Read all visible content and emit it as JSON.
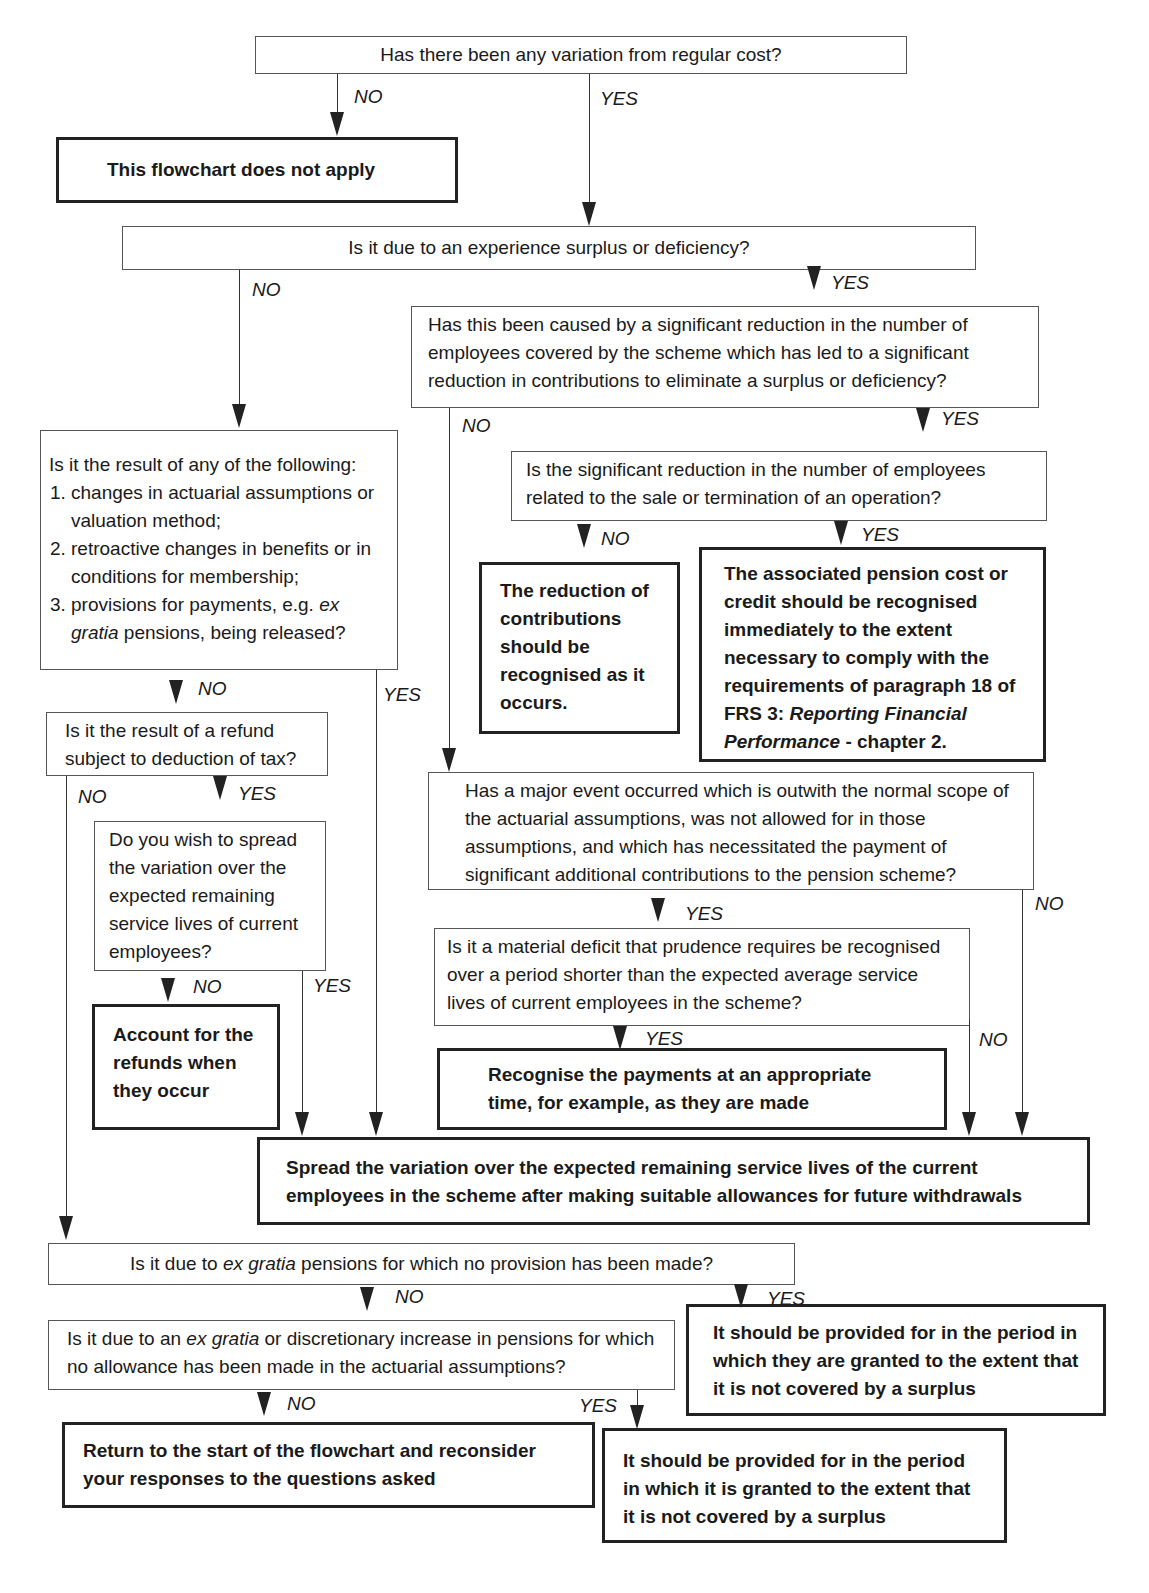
{
  "header_fragment": "",
  "nodes": {
    "q1": "Has there been any variation from regular cost?",
    "end_not_apply": "This flowchart does not apply",
    "q2": "Is it due to an experience surplus or deficiency?",
    "q3": "Has this been caused by a significant reduction in the number of employees covered by the scheme which has led to a significant reduction in contributions to eliminate a surplus or deficiency?",
    "q4": "Is the significant reduction in the number of employees related to the sale or termination of an operation?",
    "end_reduction": "The reduction of contributions should be recognised as it occurs.",
    "end_associated_a": "The associated pension cost or credit should be recognised immediately to the extent necessary to comply with the requirements of paragraph 18 of FRS 3: ",
    "end_associated_italic": "Reporting Financial Performance",
    "end_associated_b": " - chapter 2.",
    "q5_intro": "Is it the result of any of the following:",
    "q5_items": [
      "changes in actuarial assumptions or valuation method;",
      "retroactive changes in benefits or in conditions for  membership;"
    ],
    "q5_item3_a": "provisions for payments, e.g. ",
    "q5_item3_italic": "ex gratia",
    "q5_item3_b": " pensions, being released?",
    "q6": "Is it the result of a refund subject to deduction of tax?",
    "q7": "Do you wish to spread the variation over the expected remaining service lives of current employees?",
    "end_refunds": "Account for the refunds when they occur",
    "q8": "Has a major event occurred which is outwith the normal scope of the actuarial assumptions, was not allowed for in those assumptions, and which has necessitated the payment of significant additional contributions to the pension scheme?",
    "q9": "Is it a material deficit that prudence requires be recognised over a period shorter than the expected average service lives of current employees in the scheme?",
    "end_recognise_payments": "Recognise the payments at an appropriate time, for example, as they are made",
    "end_spread": "Spread the variation over the expected remaining service lives of the current employees in the scheme after making suitable allowances for future withdrawals",
    "q10_a": "Is it due to ",
    "q10_italic": "ex gratia",
    "q10_b": " pensions for which no provision has been made?",
    "end_provided_they": "It should be provided for in the period in which they are granted to the extent that it is not covered by a surplus",
    "q11_a": "Is it due to an ",
    "q11_italic": "ex gratia",
    "q11_b": " or discretionary increase in pensions for which no allowance has been made in the actuarial assumptions?",
    "end_return": "Return to the start of the flowchart and reconsider your responses to the questions asked",
    "end_provided_it": "It should be provided for in the period in which it is granted to the extent that it is not covered by a surplus"
  },
  "labels": {
    "yes": "YES",
    "no": "NO"
  }
}
